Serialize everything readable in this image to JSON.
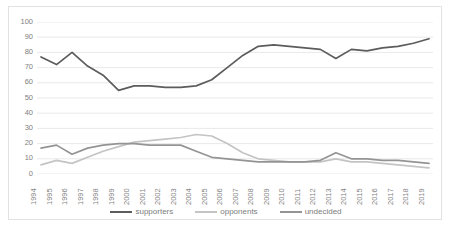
{
  "chart_data": {
    "type": "line",
    "title": "",
    "xlabel": "",
    "ylabel": "",
    "ylim": [
      0,
      100
    ],
    "ytick_step": 10,
    "yticks": [
      100,
      90,
      80,
      70,
      60,
      50,
      40,
      30,
      20,
      10,
      0
    ],
    "grid": true,
    "grid_axis": "y",
    "legend_position": "bottom",
    "categories": [
      "1994",
      "1995",
      "1996",
      "1997",
      "1998",
      "1999",
      "2000",
      "2001",
      "2002",
      "2003",
      "2004",
      "2005",
      "2006",
      "2007",
      "2008",
      "2009",
      "2010",
      "2011",
      "2012",
      "2013",
      "2014",
      "2015",
      "2016",
      "2017",
      "2018",
      "2019"
    ],
    "series": [
      {
        "name": "supporters",
        "color": "#5c5c5c",
        "values": [
          77,
          72,
          80,
          71,
          65,
          55,
          58,
          58,
          57,
          57,
          58,
          62,
          70,
          78,
          84,
          85,
          84,
          83,
          82,
          76,
          82,
          81,
          83,
          84,
          86,
          89
        ]
      },
      {
        "name": "opponents",
        "color": "#c4c4c4",
        "values": [
          6,
          9,
          7,
          11,
          15,
          18,
          21,
          22,
          23,
          24,
          26,
          25,
          20,
          14,
          10,
          9,
          8,
          8,
          8,
          10,
          8,
          8,
          7,
          6,
          5,
          4
        ]
      },
      {
        "name": "undecided",
        "color": "#949494",
        "values": [
          17,
          19,
          13,
          17,
          19,
          20,
          20,
          19,
          19,
          19,
          15,
          11,
          10,
          9,
          8,
          8,
          8,
          8,
          9,
          14,
          10,
          10,
          9,
          9,
          8,
          7
        ]
      }
    ]
  },
  "legend": [
    {
      "label": "supporters",
      "color": "#5c5c5c"
    },
    {
      "label": "opponents",
      "color": "#c4c4c4"
    },
    {
      "label": "undecided",
      "color": "#949494"
    }
  ],
  "axis": {
    "y_tick_labels": [
      "100",
      "90",
      "80",
      "70",
      "60",
      "50",
      "40",
      "30",
      "20",
      "10",
      "0"
    ],
    "x_tick_labels": [
      "1994",
      "1995",
      "1996",
      "1997",
      "1998",
      "1999",
      "2000",
      "2001",
      "2002",
      "2003",
      "2004",
      "2005",
      "2006",
      "2007",
      "2008",
      "2009",
      "2010",
      "2011",
      "2012",
      "2013",
      "2014",
      "2015",
      "2016",
      "2017",
      "2018",
      "2019"
    ]
  },
  "style": {
    "gridline_color": "#e9e9e9",
    "border_color": "#e2e2e2",
    "tick_label_color": "#808080",
    "background": "#ffffff"
  }
}
